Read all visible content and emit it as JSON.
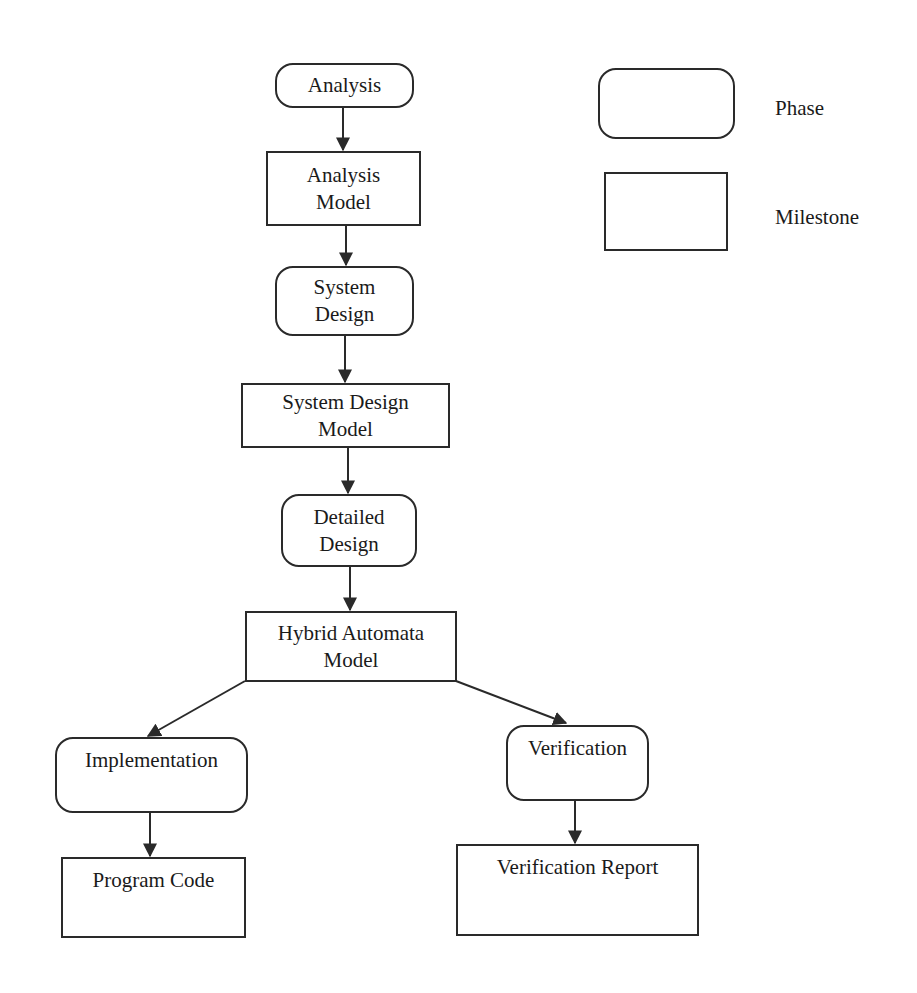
{
  "diagram": {
    "type": "flowchart",
    "nodes": [
      {
        "id": "analysis",
        "kind": "phase",
        "lines": [
          "Analysis"
        ]
      },
      {
        "id": "analysis-model",
        "kind": "milestone",
        "lines": [
          "Analysis",
          "Model"
        ]
      },
      {
        "id": "system-design",
        "kind": "phase",
        "lines": [
          "System",
          "Design"
        ]
      },
      {
        "id": "system-design-model",
        "kind": "milestone",
        "lines": [
          "System Design",
          "Model"
        ]
      },
      {
        "id": "detailed-design",
        "kind": "phase",
        "lines": [
          "Detailed",
          "Design"
        ]
      },
      {
        "id": "hybrid-automata-model",
        "kind": "milestone",
        "lines": [
          "Hybrid Automata",
          "Model"
        ]
      },
      {
        "id": "implementation",
        "kind": "phase",
        "lines": [
          "Implementation"
        ]
      },
      {
        "id": "program-code",
        "kind": "milestone",
        "lines": [
          "Program Code"
        ]
      },
      {
        "id": "verification",
        "kind": "phase",
        "lines": [
          "Verification"
        ]
      },
      {
        "id": "verification-report",
        "kind": "milestone",
        "lines": [
          "Verification Report"
        ]
      }
    ],
    "edges": [
      {
        "from": "analysis",
        "to": "analysis-model"
      },
      {
        "from": "analysis-model",
        "to": "system-design"
      },
      {
        "from": "system-design",
        "to": "system-design-model"
      },
      {
        "from": "system-design-model",
        "to": "detailed-design"
      },
      {
        "from": "detailed-design",
        "to": "hybrid-automata-model"
      },
      {
        "from": "hybrid-automata-model",
        "to": "implementation"
      },
      {
        "from": "hybrid-automata-model",
        "to": "verification"
      },
      {
        "from": "implementation",
        "to": "program-code"
      },
      {
        "from": "verification",
        "to": "verification-report"
      }
    ],
    "legend": {
      "phase_label": "Phase",
      "milestone_label": "Milestone"
    },
    "colors": {
      "stroke": "#2a2a2a",
      "background": "#ffffff",
      "text": "#1a1a1a"
    }
  }
}
